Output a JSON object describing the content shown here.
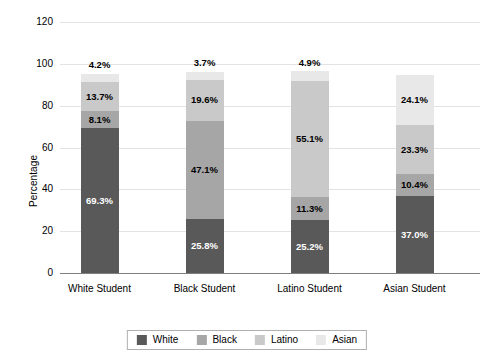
{
  "chart_data": {
    "type": "bar",
    "subtype": "stacked-bar",
    "title": "",
    "xlabel": "",
    "ylabel": "Percentage",
    "ylim": [
      0,
      120
    ],
    "yticks": [
      0,
      20,
      40,
      60,
      80,
      100,
      120
    ],
    "grid": true,
    "legend_position": "bottom",
    "categories": [
      "White Student",
      "Black Student",
      "Latino Student",
      "Asian Student"
    ],
    "series": [
      {
        "name": "White",
        "color": "#595959",
        "values": [
          69.3,
          25.8,
          25.2,
          37.0
        ]
      },
      {
        "name": "Black",
        "color": "#a6a6a6",
        "values": [
          8.1,
          47.1,
          11.3,
          10.4
        ]
      },
      {
        "name": "Latino",
        "color": "#c9c9c9",
        "values": [
          13.7,
          19.6,
          55.1,
          23.3
        ]
      },
      {
        "name": "Asian",
        "color": "#e8e8e8",
        "values": [
          4.2,
          3.7,
          4.9,
          24.1
        ]
      }
    ],
    "bar_labels": [
      [
        "69.3%",
        "8.1%",
        "13.7%",
        "4.2%"
      ],
      [
        "25.8%",
        "47.1%",
        "19.6%",
        "3.7%"
      ],
      [
        "25.2%",
        "11.3%",
        "55.1%",
        "4.9%"
      ],
      [
        "37.0%",
        "10.4%",
        "23.3%",
        "24.1%"
      ]
    ],
    "bar_label_outside": [
      [
        false,
        false,
        false,
        true
      ],
      [
        false,
        false,
        false,
        true
      ],
      [
        false,
        false,
        false,
        true
      ],
      [
        false,
        false,
        false,
        false
      ]
    ],
    "bar_totals": [
      95.3,
      96.2,
      96.5,
      94.8
    ]
  },
  "axis": {
    "y_title": "Percentage",
    "y_tick_labels": [
      "0",
      "20",
      "40",
      "60",
      "80",
      "100",
      "120"
    ],
    "x_tick_labels": [
      "White Student",
      "Black Student",
      "Latino Student",
      "Asian Student"
    ]
  },
  "legend": {
    "entries": [
      {
        "label": "White",
        "color": "#595959"
      },
      {
        "label": "Black",
        "color": "#a6a6a6"
      },
      {
        "label": "Latino",
        "color": "#c9c9c9"
      },
      {
        "label": "Asian",
        "color": "#e8e8e8"
      }
    ]
  },
  "style": {
    "gridline_color": "#e3e3e3",
    "axis_color": "#7f7f7f",
    "background": "#ffffff",
    "label_light": "#ffffff",
    "label_dark": "#000000"
  }
}
